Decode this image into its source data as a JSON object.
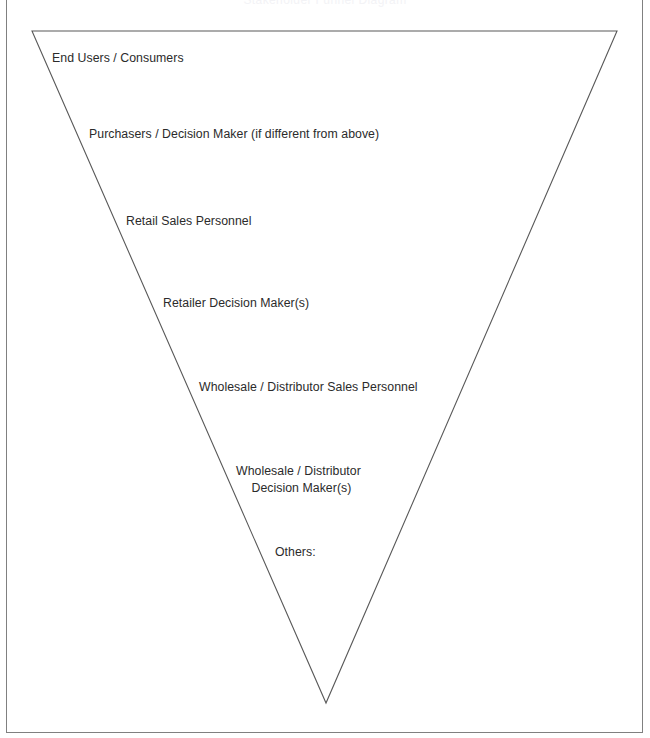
{
  "page": {
    "title_clipped": "Stakeholder Funnel Diagram",
    "background_color": "#ffffff",
    "frame_color": "#808080"
  },
  "diagram": {
    "name": "inverted-triangle-funnel",
    "type": "funnel",
    "outline_color": "#595959",
    "divider_color": "#b7b7b7",
    "fill_color": "#ffffff",
    "apex": {
      "x": 326,
      "y": 703
    },
    "top_left": {
      "x": 32,
      "y": 31
    },
    "top_right": {
      "x": 617,
      "y": 31
    },
    "tiers": [
      {
        "index": 1,
        "name": "end-users-consumers",
        "label": "End Users / Consumers",
        "label_x": 52,
        "label_y": 50,
        "top_y": 31,
        "bottom_y": 117,
        "multiline": false
      },
      {
        "index": 2,
        "name": "purchasers-decision-maker",
        "label": "Purchasers / Decision Maker (if different from above)",
        "label_x": 89,
        "label_y": 126,
        "top_y": 117,
        "bottom_y": 203,
        "multiline": false
      },
      {
        "index": 3,
        "name": "retail-sales-personnel",
        "label": "Retail Sales Personnel",
        "label_x": 126,
        "label_y": 213,
        "top_y": 203,
        "bottom_y": 285,
        "multiline": false
      },
      {
        "index": 4,
        "name": "retailer-decision-makers",
        "label": "Retailer Decision Maker(s)",
        "label_x": 163,
        "label_y": 295,
        "top_y": 285,
        "bottom_y": 368,
        "multiline": false
      },
      {
        "index": 5,
        "name": "wholesale-distributor-sales-personnel",
        "label": "Wholesale / Distributor Sales Personnel",
        "label_x": 199,
        "label_y": 379,
        "top_y": 368,
        "bottom_y": 455,
        "multiline": false
      },
      {
        "index": 6,
        "name": "wholesale-distributor-decision-makers",
        "label": "Wholesale / Distributor\nDecision Maker(s)",
        "label_x": 236,
        "label_y": 463,
        "top_y": 455,
        "bottom_y": 533,
        "multiline": true
      },
      {
        "index": 7,
        "name": "others",
        "label": "Others:",
        "label_x": 275,
        "label_y": 544,
        "top_y": 533,
        "bottom_y": 623,
        "multiline": false
      },
      {
        "index": 8,
        "name": "unlabeled-apex-tier",
        "label": "",
        "label_x": 300,
        "label_y": 640,
        "top_y": 623,
        "bottom_y": 703,
        "multiline": false
      }
    ]
  }
}
